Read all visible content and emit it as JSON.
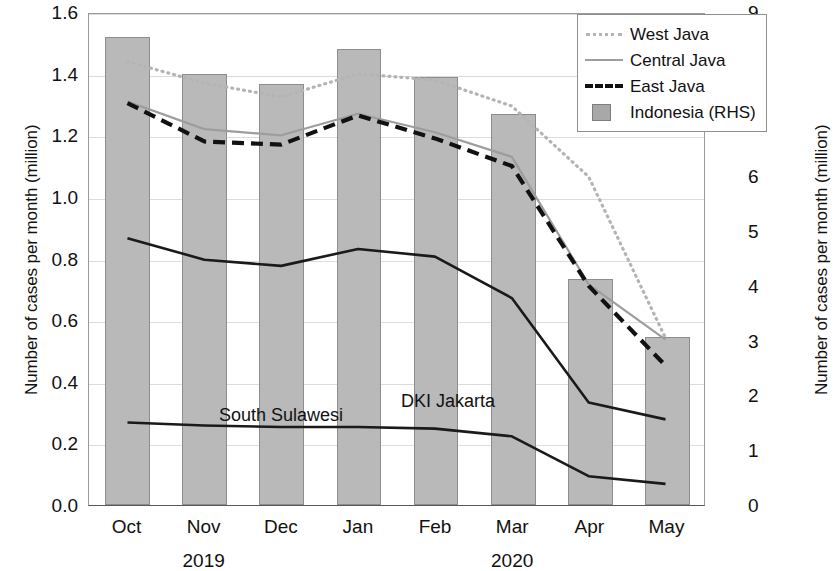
{
  "chart_data": {
    "type": "line",
    "title": "",
    "categories": [
      "Oct",
      "Nov",
      "Dec",
      "Jan",
      "Feb",
      "Mar",
      "Apr",
      "May"
    ],
    "year_labels": [
      {
        "label": "2019",
        "at_category": "Nov"
      },
      {
        "label": "2020",
        "at_category": "Mar"
      }
    ],
    "xlabel": "",
    "ylabel": "Number of cases per month (million)",
    "y2label": "Number of cases per month (million)",
    "ylim": [
      0.0,
      1.6
    ],
    "y2lim": [
      0,
      9
    ],
    "yticks": [
      "0.0",
      "0.2",
      "0.4",
      "0.6",
      "0.8",
      "1.0",
      "1.2",
      "1.4",
      "1.6"
    ],
    "y2ticks": [
      "0",
      "1",
      "2",
      "3",
      "4",
      "5",
      "6",
      "7",
      "8",
      "9"
    ],
    "grid": true,
    "legend_position": "top-right",
    "series": [
      {
        "name": "West Java",
        "axis": "left",
        "style": "dotted",
        "color": "#b4b4b4",
        "in_legend": true,
        "values": [
          1.445,
          1.375,
          1.33,
          1.405,
          1.385,
          1.3,
          1.07,
          0.545
        ]
      },
      {
        "name": "Central Java",
        "axis": "left",
        "style": "solid",
        "color": "#9d9d9d",
        "in_legend": true,
        "values": [
          1.315,
          1.225,
          1.205,
          1.275,
          1.215,
          1.135,
          0.72,
          0.54
        ]
      },
      {
        "name": "East Java",
        "axis": "left",
        "style": "dashed",
        "color": "#111111",
        "in_legend": true,
        "values": [
          1.31,
          1.185,
          1.175,
          1.27,
          1.195,
          1.105,
          0.715,
          0.455
        ]
      },
      {
        "name": "DKI Jakarta",
        "axis": "left",
        "style": "solid",
        "color": "#1a1a1a",
        "in_legend": false,
        "annotated": true,
        "values": [
          0.87,
          0.8,
          0.78,
          0.835,
          0.81,
          0.675,
          0.335,
          0.28
        ]
      },
      {
        "name": "South Sulawesi",
        "axis": "left",
        "style": "solid",
        "color": "#1a1a1a",
        "in_legend": false,
        "annotated": true,
        "values": [
          0.27,
          0.26,
          0.255,
          0.255,
          0.25,
          0.225,
          0.095,
          0.07
        ]
      },
      {
        "name": "Indonesia (RHS)",
        "axis": "right",
        "style": "bar",
        "color": "#b9b9b9",
        "in_legend": true,
        "values": [
          8.55,
          7.87,
          7.68,
          8.32,
          7.81,
          7.14,
          4.13,
          3.06
        ]
      }
    ],
    "annotations": [
      {
        "text": "DKI Jakarta",
        "series": "DKI Jakarta"
      },
      {
        "text": "South Sulawesi",
        "series": "South Sulawesi"
      }
    ]
  },
  "legend": {
    "entries": [
      {
        "label": "West Java",
        "symbol": "dotted-line"
      },
      {
        "label": "Central Java",
        "symbol": "solid-line"
      },
      {
        "label": "East Java",
        "symbol": "dashed-line"
      },
      {
        "label": "Indonesia (RHS)",
        "symbol": "filled-square"
      }
    ]
  }
}
